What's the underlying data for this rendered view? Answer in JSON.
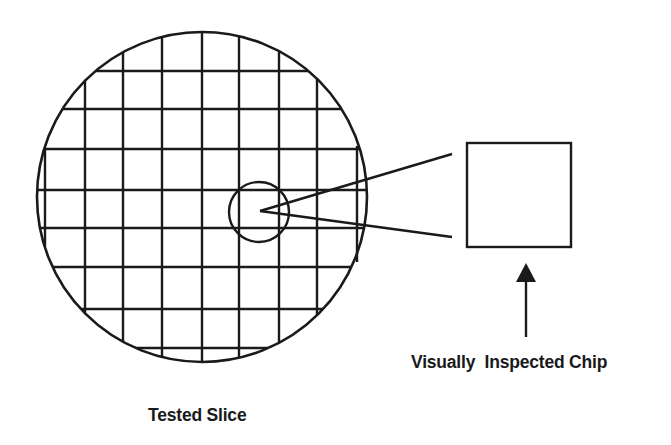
{
  "labels": {
    "wafer": "Tested Slice",
    "chip": "Visually  Inspected Chip"
  },
  "colors": {
    "stroke": "#1a1a1a",
    "background": "#ffffff"
  },
  "wafer": {
    "center": [
      202,
      197
    ],
    "radius": 165,
    "grid_vertical_x": [
      85,
      123,
      162,
      202,
      239,
      279,
      317
    ],
    "grid_horizontal_y": [
      71,
      109,
      149,
      190,
      228,
      267,
      309,
      348
    ],
    "edge_chords": [
      {
        "x": 45,
        "y1": 149,
        "y2": 246
      },
      {
        "x": 357,
        "y1": 146,
        "y2": 262
      }
    ]
  },
  "highlight_circle": {
    "center": [
      259,
      212
    ],
    "radius": 30
  },
  "callout_lines": {
    "vertex": [
      260,
      211
    ],
    "upper_end": [
      452,
      154
    ],
    "lower_end": [
      452,
      237
    ]
  },
  "chip_box": {
    "x": 467,
    "y": 143,
    "width": 104,
    "height": 104
  },
  "arrow": {
    "tip": [
      526,
      263
    ],
    "head_base_y": 282,
    "head_half_width": 10,
    "tail_y": 337
  }
}
